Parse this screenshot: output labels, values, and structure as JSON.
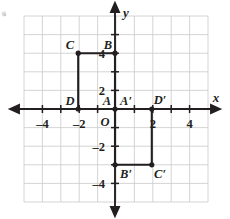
{
  "figure": {
    "axes": {
      "x_axis_label": "x",
      "y_axis_label": "y",
      "origin_label": "O",
      "x_tick_labels": [
        "–4",
        "–2",
        "2",
        "4"
      ],
      "y_tick_labels": [
        "4",
        "2",
        "–2",
        "–4"
      ],
      "x_range": [
        -5,
        5
      ],
      "y_range": [
        -5,
        5
      ],
      "grid": true,
      "grid_color": "#c8c8c8",
      "axis_color": "#231f20"
    },
    "points": [
      {
        "name": "A",
        "label": "A",
        "x": 0,
        "y": 0
      },
      {
        "name": "B",
        "label": "B",
        "x": 0,
        "y": 3
      },
      {
        "name": "C",
        "label": "C",
        "x": -2,
        "y": 3
      },
      {
        "name": "D",
        "label": "D",
        "x": -2,
        "y": 0
      },
      {
        "name": "A'",
        "label": "A′",
        "x": 0,
        "y": 0
      },
      {
        "name": "B'",
        "label": "B′",
        "x": 0,
        "y": -3
      },
      {
        "name": "C'",
        "label": "C′",
        "x": 2,
        "y": -3
      },
      {
        "name": "D'",
        "label": "D′",
        "x": 2,
        "y": 0
      }
    ],
    "shapes": [
      {
        "name": "rectangle-ABCD",
        "vertices": [
          "A",
          "B",
          "C",
          "D"
        ]
      },
      {
        "name": "rectangle-A1B1C1D1",
        "vertices": [
          "A′",
          "B′",
          "C′",
          "D′"
        ]
      }
    ],
    "shape_color": "#231f20"
  }
}
